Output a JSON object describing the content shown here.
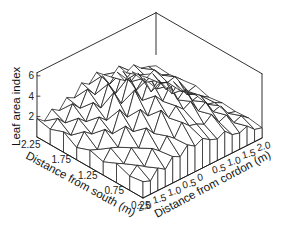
{
  "chart_data": {
    "type": "surface3d",
    "title": "",
    "zlabel": "Leaf area index",
    "xlabel": "Distance from south (m)",
    "ylabel": "Distance from cordon (m)",
    "z_ticks": [
      "2",
      "4",
      "6"
    ],
    "z_tick_values": [
      2,
      4,
      6
    ],
    "zlim": [
      0,
      6
    ],
    "x_ticks": [
      "2.25",
      "1.75",
      "1.25",
      "0.75",
      "0.25"
    ],
    "x_tick_values": [
      2.25,
      1.75,
      1.25,
      0.75,
      0.25
    ],
    "y_ticks": [
      "2.0",
      "1.5",
      "1.0",
      "0.5",
      "0",
      "0.5",
      "1.0",
      "1.5",
      "2.0"
    ],
    "y_tick_values": [
      -2.0,
      -1.5,
      -1.0,
      -0.5,
      0,
      0.5,
      1.0,
      1.5,
      2.0
    ],
    "grid_rows_x": 9,
    "grid_cols_y": 17,
    "note": "Wireframe mesh of leaf area index; peaks ~5-6 near cordon (y≈0), lower ~1-2 at edges",
    "z_values": [
      [
        1.8,
        1.2,
        2.0,
        1.5,
        2.4,
        2.0,
        3.1,
        2.6,
        3.4,
        2.8,
        2.2,
        2.9,
        1.9,
        2.3,
        1.6,
        1.4,
        1.1
      ],
      [
        1.5,
        2.2,
        1.4,
        2.9,
        2.1,
        3.6,
        2.7,
        4.2,
        3.0,
        3.8,
        2.6,
        3.1,
        2.4,
        1.8,
        2.2,
        1.3,
        1.0
      ],
      [
        2.0,
        1.3,
        2.6,
        1.9,
        3.4,
        2.5,
        4.5,
        3.2,
        5.0,
        3.6,
        4.1,
        2.8,
        3.3,
        2.0,
        1.7,
        1.9,
        1.2
      ],
      [
        1.2,
        2.4,
        1.8,
        3.1,
        2.4,
        4.8,
        3.3,
        5.6,
        3.9,
        4.7,
        3.0,
        3.8,
        2.5,
        2.9,
        1.6,
        1.2,
        1.4
      ],
      [
        1.7,
        1.4,
        3.0,
        2.2,
        4.2,
        3.1,
        5.4,
        4.0,
        5.9,
        4.4,
        5.1,
        3.2,
        4.0,
        2.4,
        2.1,
        1.5,
        1.0
      ],
      [
        1.3,
        2.3,
        2.0,
        3.7,
        2.8,
        4.6,
        3.6,
        5.2,
        4.3,
        5.5,
        3.7,
        4.4,
        2.9,
        3.1,
        1.8,
        1.6,
        1.2
      ],
      [
        1.9,
        1.5,
        2.7,
        2.3,
        3.9,
        3.0,
        4.9,
        3.8,
        4.6,
        3.9,
        4.3,
        3.0,
        3.5,
        2.2,
        2.4,
        1.3,
        1.1
      ],
      [
        1.4,
        2.1,
        1.6,
        3.0,
        2.4,
        3.5,
        2.9,
        4.1,
        3.4,
        3.2,
        2.8,
        3.4,
        2.3,
        2.6,
        1.5,
        1.8,
        1.2
      ],
      [
        1.6,
        1.3,
        2.2,
        1.7,
        2.6,
        2.2,
        3.0,
        2.5,
        2.9,
        2.4,
        2.1,
        2.5,
        1.8,
        1.6,
        1.9,
        1.2,
        1.0
      ]
    ]
  },
  "labels": {
    "zlabel": "Leaf area index",
    "xlabel": "Distance from south (m)",
    "ylabel": "Distance from cordon (m)"
  }
}
